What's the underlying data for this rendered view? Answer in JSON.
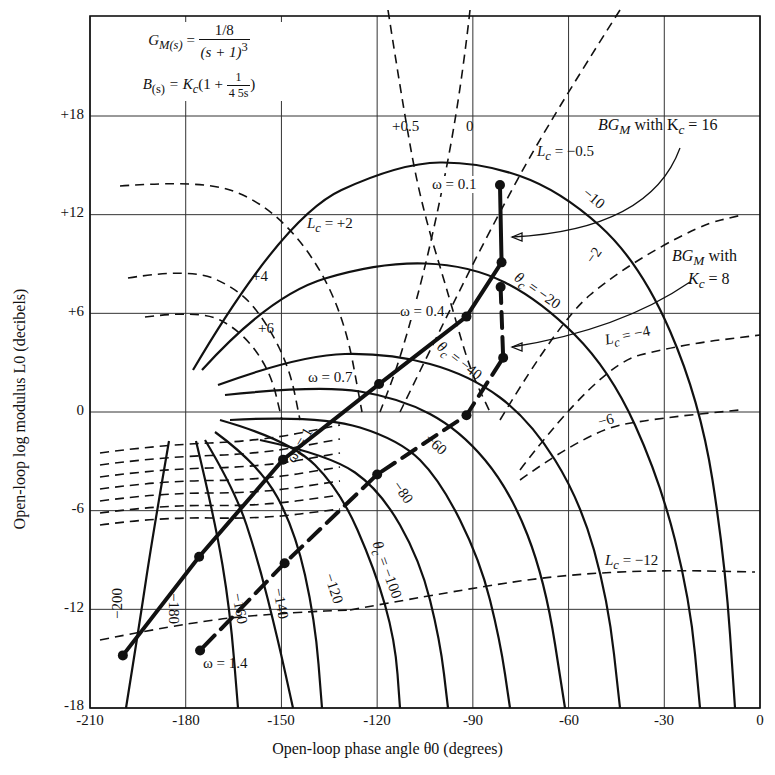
{
  "chart_data": {
    "type": "line",
    "xlabel": "Open-loop phase angle θ0 (degrees)",
    "ylabel": "Open-loop log modulus L0 (decibels)",
    "xlim": [
      -210,
      0
    ],
    "ylim": [
      -18,
      18
    ],
    "grid": true,
    "x_ticks": [
      "-210",
      "-180",
      "-150",
      "-120",
      "-90",
      "-60",
      "-30",
      "0"
    ],
    "x_tick_values": [
      -210,
      -180,
      -150,
      -120,
      -90,
      -60,
      -30,
      0
    ],
    "y_ticks": [
      "+18",
      "+12",
      "+6",
      "0",
      "-6",
      "-12",
      "-18"
    ],
    "y_tick_values": [
      18,
      12,
      6,
      0,
      -6,
      -12,
      -18
    ],
    "formula": {
      "gm_lhs": "G",
      "gm_sub": "M(s)",
      "gm_num": "1/8",
      "gm_den": "(s + 1)",
      "gm_den_exp": "3",
      "b_lhs": "B",
      "b_sub": "(s)",
      "b_rhs_pre": "= K",
      "b_rhs_sub": "c",
      "b_rhs_mid": "(1 +",
      "b_frac_num": "1",
      "b_frac_den": "4 5s",
      "b_rhs_post": ")"
    },
    "series": [
      {
        "name": "BG_M with Kc = 16",
        "style": "thick-solid",
        "points": [
          {
            "theta": -81.5,
            "L": 13.8,
            "label": "ω = 0.1"
          },
          {
            "theta": -81,
            "L": 9.1
          },
          {
            "theta": -92,
            "L": 5.8,
            "label": "ω = 0.4"
          },
          {
            "theta": -119.4,
            "L": 1.7,
            "label": "ω = 0.7"
          },
          {
            "theta": -149.5,
            "L": -2.9,
            "label": "ωr = 1"
          },
          {
            "theta": -175.8,
            "L": -8.8
          },
          {
            "theta": -199.7,
            "L": -14.8
          }
        ]
      },
      {
        "name": "BG_M with Kc = 8",
        "style": "thick-dashed",
        "points": [
          {
            "theta": -81.3,
            "L": 7.6
          },
          {
            "theta": -80.5,
            "L": 3.3
          },
          {
            "theta": -92,
            "L": -0.2
          },
          {
            "theta": -120,
            "L": -3.8
          },
          {
            "theta": -149,
            "L": -9.2
          },
          {
            "theta": -175.5,
            "L": -14.5,
            "label": "ω = 1.4"
          }
        ]
      }
    ],
    "closed_loop_log_modulus_contours": [
      {
        "label": "+0.5",
        "Lc": 0.5
      },
      {
        "label": "0",
        "Lc": 0
      },
      {
        "label": "Lc = -0.5",
        "Lc": -0.5
      },
      {
        "label": "Lc = +2",
        "Lc": 2
      },
      {
        "label": "+4",
        "Lc": 4
      },
      {
        "label": "+6",
        "Lc": 6
      },
      {
        "label": "-2",
        "Lc": -2
      },
      {
        "label": "Lc = -4",
        "Lc": -4
      },
      {
        "label": "-6",
        "Lc": -6
      },
      {
        "label": "Lc = -12",
        "Lc": -12
      }
    ],
    "closed_loop_phase_contours": [
      {
        "label": "-10",
        "theta_c": -10
      },
      {
        "label": "θc = -20",
        "theta_c": -20
      },
      {
        "label": "θc = -40",
        "theta_c": -40
      },
      {
        "label": "-60",
        "theta_c": -60
      },
      {
        "label": "-80",
        "theta_c": -80
      },
      {
        "label": "θc = -100",
        "theta_c": -100
      },
      {
        "label": "-120",
        "theta_c": -120
      },
      {
        "label": "-140",
        "theta_c": -140
      },
      {
        "label": "-160",
        "theta_c": -160
      },
      {
        "label": "-180",
        "theta_c": -180
      },
      {
        "label": "-200",
        "theta_c": -200
      }
    ],
    "annotations": [
      {
        "text": "BG_M with Kc = 16"
      },
      {
        "text": "BG_M with Kc = 8"
      }
    ]
  },
  "labels": {
    "lc_p05": "+0.5",
    "lc_0": "0",
    "lc_m05": "= −0.5",
    "lc_p2": "= +2",
    "lc_p4": "+4",
    "lc_p6": "+6",
    "lc_m2": "−2",
    "lc_m4": "= −4",
    "lc_m6": "−6",
    "lc_m12": "= −12",
    "tc_m10": "−10",
    "tc_m20": "= −20",
    "tc_m40": "= −40",
    "tc_m60": "−60",
    "tc_m80": "−80",
    "tc_m100": "= −100",
    "tc_m120": "−120",
    "tc_m140": "−140",
    "tc_m160": "−160",
    "tc_m180": "−180",
    "tc_m200": "−200",
    "w01": "ω = 0.1",
    "w04": "ω = 0.4",
    "w07": "ω = 0.7",
    "wr1": "= 1",
    "w14": "ω = 1.4",
    "kc16_a": "with K",
    "kc16_b": "= 16",
    "kc8_a": "with",
    "kc8_b": "= 8"
  }
}
